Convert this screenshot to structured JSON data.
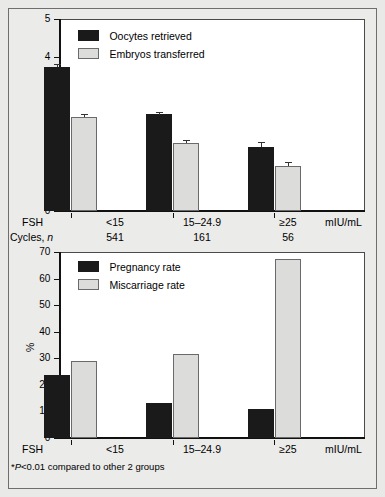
{
  "figure": {
    "background": "#e9e9e7",
    "series_colors": {
      "dark": "#1a1a1a",
      "light": "#dcdcda"
    },
    "footnote": "*P<0.01 compared to other 2 groups",
    "footnote_prefix": "*",
    "footnote_italic": "P",
    "footnote_rest": "<0.01 compared to other 2 groups"
  },
  "shared": {
    "categories": [
      "<15",
      "15–24.9",
      "≥25"
    ],
    "group_label": "FSH",
    "unit_label": "mIU/mL",
    "cycles_label_text": "Cycles, ",
    "cycles_label_italic": "n",
    "cycles_values": [
      "541",
      "161",
      "56"
    ]
  },
  "chart_data": [
    {
      "type": "bar",
      "title": "",
      "xlabel": "FSH",
      "ylabel": "",
      "ylim": [
        0,
        5
      ],
      "yticks": [
        0,
        1,
        2,
        3,
        4,
        5
      ],
      "ytick_labels": [
        "0",
        "1",
        "2",
        "3",
        "4",
        "5"
      ],
      "grid": false,
      "legend_position": "top-left",
      "categories": [
        "<15",
        "15–24.9",
        "≥25"
      ],
      "unit": "mIU/mL",
      "series": [
        {
          "name": "Oocytes retrieved",
          "color": "#1a1a1a",
          "values": [
            3.74,
            2.52,
            1.67
          ],
          "errors": [
            0.09,
            0.07,
            0.12
          ]
        },
        {
          "name": "Embryos transferred",
          "color": "#dcdcda",
          "values": [
            2.46,
            1.77,
            1.16
          ],
          "errors": [
            0.07,
            0.08,
            0.11
          ]
        }
      ]
    },
    {
      "type": "bar",
      "title": "",
      "xlabel": "FSH",
      "ylabel": "%",
      "ylim": [
        0,
        70
      ],
      "yticks": [
        0,
        10,
        20,
        30,
        40,
        50,
        60,
        70
      ],
      "ytick_labels": [
        "0",
        "10",
        "20",
        "30",
        "40",
        "50",
        "60",
        "70"
      ],
      "grid": false,
      "legend_position": "top-left",
      "categories": [
        "<15",
        "15–24.9",
        "≥25"
      ],
      "unit": "mIU/mL",
      "series": [
        {
          "name": "Pregnancy rate",
          "color": "#1a1a1a",
          "values": [
            23.6,
            13.0,
            11.0
          ],
          "errors": [
            0,
            0,
            0
          ]
        },
        {
          "name": "Miscarriage rate",
          "color": "#dcdcda",
          "values": [
            28.8,
            31.8,
            67.4
          ],
          "errors": [
            0,
            0,
            0
          ]
        }
      ]
    }
  ]
}
